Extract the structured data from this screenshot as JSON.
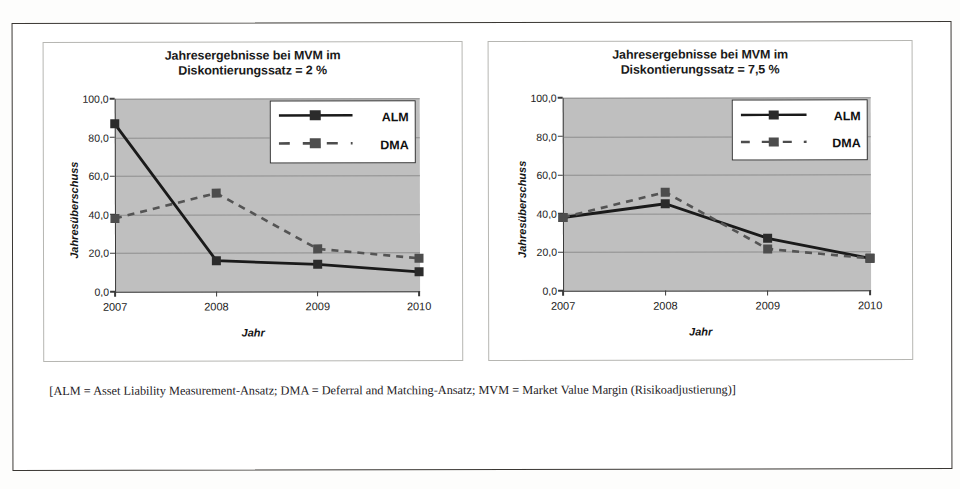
{
  "figure": {
    "caption": "[ALM = Asset Liability Measurement-Ansatz; DMA = Deferral and Matching-Ansatz; MVM = Market Value Margin (Risikoadjustierung)]"
  },
  "chart_data": [
    {
      "type": "line",
      "id": "chart-left",
      "title": "Jahresergebnisse bei MVM im",
      "title_line2": "Diskontierungssatz = 2 %",
      "xlabel": "Jahr",
      "ylabel": "Jahresüberschuss",
      "categories": [
        "2007",
        "2008",
        "2009",
        "2010"
      ],
      "yticks": [
        "0,0",
        "20,0",
        "40,0",
        "60,0",
        "80,0",
        "100,0"
      ],
      "ylim": [
        0,
        100
      ],
      "grid": true,
      "legend_position": "top-right",
      "plot_bg": "#bfbfbf",
      "series": [
        {
          "name": "ALM",
          "values": [
            87.0,
            16.0,
            14.0,
            10.0
          ],
          "color": "#1a1a1a",
          "style": "solid",
          "marker": "square"
        },
        {
          "name": "DMA",
          "values": [
            38.0,
            51.0,
            22.0,
            17.0
          ],
          "color": "#545454",
          "style": "dashed",
          "marker": "square"
        }
      ]
    },
    {
      "type": "line",
      "id": "chart-right",
      "title": "Jahresergebnisse bei MVM im",
      "title_line2": "Diskontierungssatz = 7,5 %",
      "xlabel": "Jahr",
      "ylabel": "Jahresüberschuss",
      "categories": [
        "2007",
        "2008",
        "2009",
        "2010"
      ],
      "yticks": [
        "0,0",
        "20,0",
        "40,0",
        "60,0",
        "80,0",
        "100,0"
      ],
      "ylim": [
        0,
        100
      ],
      "grid": true,
      "legend_position": "top-right",
      "plot_bg": "#bfbfbf",
      "series": [
        {
          "name": "ALM",
          "values": [
            38.0,
            45.0,
            27.0,
            16.5
          ],
          "color": "#1a1a1a",
          "style": "solid",
          "marker": "square"
        },
        {
          "name": "DMA",
          "values": [
            38.0,
            51.0,
            21.5,
            16.5
          ],
          "color": "#545454",
          "style": "dashed",
          "marker": "square"
        }
      ]
    }
  ]
}
